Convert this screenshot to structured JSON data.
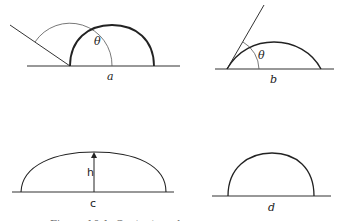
{
  "figure": {
    "panels": [
      {
        "id": "a",
        "label": "a",
        "angle_label": "θ",
        "description": "drop with contact angle greater than 90 degrees"
      },
      {
        "id": "b",
        "label": "b",
        "angle_label": "θ",
        "description": "drop with contact angle less than 90 degrees"
      },
      {
        "id": "c",
        "label": "c",
        "height_label": "h",
        "description": "flattened drop with height h"
      },
      {
        "id": "d",
        "label": "d",
        "description": "hemispherical drop"
      }
    ],
    "caption": "Figure 10.1. Contact angle"
  },
  "colors": {
    "stroke": "#222222",
    "thin_stroke": "#555555",
    "background": "#ffffff"
  }
}
